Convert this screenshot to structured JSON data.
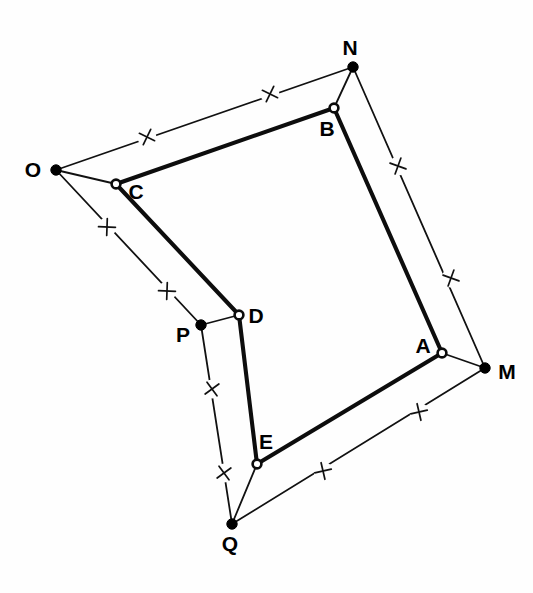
{
  "figure": {
    "background_color": "#fefefe",
    "ink_color": "#000000",
    "width": 533,
    "height": 593
  },
  "points": {
    "N": {
      "label": "N",
      "x": 353,
      "y": 67,
      "style": "filled",
      "label_x": 350,
      "label_y": 49
    },
    "B": {
      "label": "B",
      "x": 334,
      "y": 108,
      "style": "hollow",
      "label_x": 327,
      "label_y": 130
    },
    "O": {
      "label": "O",
      "x": 56,
      "y": 170,
      "style": "filled",
      "label_x": 33,
      "label_y": 171
    },
    "C": {
      "label": "C",
      "x": 116,
      "y": 184,
      "style": "hollow",
      "label_x": 136,
      "label_y": 193
    },
    "D": {
      "label": "D",
      "x": 239,
      "y": 315,
      "style": "hollow",
      "label_x": 256,
      "label_y": 317
    },
    "P": {
      "label": "P",
      "x": 201,
      "y": 325,
      "style": "filled",
      "label_x": 183,
      "label_y": 336
    },
    "A": {
      "label": "A",
      "x": 442,
      "y": 353,
      "style": "hollow",
      "label_x": 423,
      "label_y": 347
    },
    "M": {
      "label": "M",
      "x": 485,
      "y": 368,
      "style": "filled",
      "label_x": 507,
      "label_y": 373
    },
    "E": {
      "label": "E",
      "x": 257,
      "y": 464,
      "style": "hollow",
      "label_x": 266,
      "label_y": 443
    },
    "Q": {
      "label": "Q",
      "x": 232,
      "y": 524,
      "style": "filled",
      "label_x": 230,
      "label_y": 545
    }
  },
  "inner_pentagon": {
    "name": "pentagon-ABCDE",
    "vertices": [
      "A",
      "B",
      "C",
      "D",
      "E"
    ],
    "stroke_width": 4.1,
    "edges": [
      {
        "name": "edge-AB",
        "from": "A",
        "to": "B"
      },
      {
        "name": "edge-BC",
        "from": "B",
        "to": "C"
      },
      {
        "name": "edge-CD",
        "from": "C",
        "to": "D"
      },
      {
        "name": "edge-DE",
        "from": "D",
        "to": "E"
      },
      {
        "name": "edge-EA",
        "from": "E",
        "to": "A"
      }
    ]
  },
  "outer_star": {
    "name": "star-MNOPQ",
    "vertices": [
      "M",
      "N",
      "O",
      "P",
      "Q"
    ],
    "stroke_width": 1.8,
    "edges": [
      {
        "name": "edge-ON",
        "from": "O",
        "to": "N",
        "ticks": 2
      },
      {
        "name": "edge-NM",
        "from": "N",
        "to": "M",
        "ticks": 2
      },
      {
        "name": "edge-MQ",
        "from": "M",
        "to": "Q",
        "ticks": 2
      },
      {
        "name": "edge-QP",
        "from": "Q",
        "to": "P",
        "ticks": 2
      },
      {
        "name": "edge-PO",
        "from": "P",
        "to": "O",
        "ticks": 2
      }
    ],
    "spokes": [
      {
        "name": "spoke-NB",
        "from": "N",
        "to": "B"
      },
      {
        "name": "spoke-OC",
        "from": "O",
        "to": "C"
      },
      {
        "name": "spoke-PD",
        "from": "P",
        "to": "D"
      },
      {
        "name": "spoke-QE",
        "from": "Q",
        "to": "E"
      },
      {
        "name": "spoke-MA",
        "from": "M",
        "to": "A"
      }
    ]
  },
  "tick_marks": [
    {
      "name": "tick-ON-1",
      "glyph": "x",
      "x": 147,
      "y": 137,
      "angle": -19,
      "edge": "edge-ON"
    },
    {
      "name": "tick-ON-2",
      "glyph": "x",
      "x": 270,
      "y": 94,
      "angle": -19,
      "edge": "edge-ON"
    },
    {
      "name": "tick-NM-1",
      "glyph": "x",
      "x": 398,
      "y": 166,
      "angle": 65,
      "edge": "edge-NM"
    },
    {
      "name": "tick-NM-2",
      "glyph": "x",
      "x": 451,
      "y": 278,
      "angle": 65,
      "edge": "edge-NM"
    },
    {
      "name": "tick-MQ-1",
      "glyph": "x",
      "x": 419,
      "y": 412,
      "angle": 32,
      "edge": "edge-MQ"
    },
    {
      "name": "tick-MQ-2",
      "glyph": "x",
      "x": 323,
      "y": 471,
      "angle": 32,
      "edge": "edge-MQ"
    },
    {
      "name": "tick-QP-1",
      "glyph": "x",
      "x": 224,
      "y": 473,
      "angle": -81,
      "edge": "edge-QP"
    },
    {
      "name": "tick-QP-2",
      "glyph": "x",
      "x": 212,
      "y": 389,
      "angle": -81,
      "edge": "edge-QP"
    },
    {
      "name": "tick-PO-1",
      "glyph": "x",
      "x": 167,
      "y": 291,
      "angle": 47,
      "edge": "edge-PO"
    },
    {
      "name": "tick-PO-2",
      "glyph": "x",
      "x": 107,
      "y": 227,
      "angle": 47,
      "edge": "edge-PO"
    }
  ],
  "tick_style": {
    "arm_length": 6.0,
    "stroke_width": 1.7,
    "gap": 9.5
  }
}
